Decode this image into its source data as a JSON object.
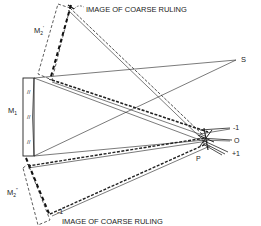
{
  "diagram": {
    "labels": {
      "top_caption": "IMAGE OF COARSE RULING",
      "bottom_caption": "IMAGE OF COARSE RULING",
      "m2_prime": "M",
      "m2_prime_sub": "2",
      "m2_prime_sup": "'",
      "m1": "M",
      "m1_sub": "1",
      "m2_double_prime": "M",
      "m2_double_prime_sub": "2",
      "m2_double_prime_sup": "\"",
      "source": "S",
      "point_p": "P",
      "order_minus1": "-1",
      "order_zero": "O",
      "order_plus1": "+1",
      "bottom_order_minus1": "-1"
    },
    "colors": {
      "line": "#222222",
      "background": "#ffffff"
    }
  }
}
